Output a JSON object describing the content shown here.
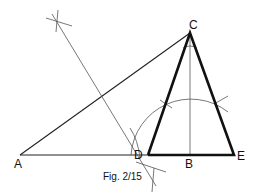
{
  "figure": {
    "caption": "Fig. 2/15",
    "points": [
      {
        "id": "A",
        "label": "A"
      },
      {
        "id": "B",
        "label": "B"
      },
      {
        "id": "C",
        "label": "C"
      },
      {
        "id": "D",
        "label": "D"
      },
      {
        "id": "E",
        "label": "E"
      }
    ],
    "segments": [
      {
        "name": "AC",
        "style": "construction"
      },
      {
        "name": "AE",
        "style": "construction"
      },
      {
        "name": "CD",
        "style": "bold"
      },
      {
        "name": "CE",
        "style": "bold"
      },
      {
        "name": "DE",
        "style": "bold"
      },
      {
        "name": "CB",
        "style": "construction"
      },
      {
        "name": "perpendicular-bisector-of-AC",
        "style": "construction"
      }
    ],
    "colors": {
      "ink": "#111111",
      "construction": "#555555",
      "background": "#ffffff"
    }
  }
}
